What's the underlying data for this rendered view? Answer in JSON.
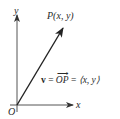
{
  "diagram": {
    "type": "vector-in-plane",
    "axes": {
      "x_label": "x",
      "y_label": "y",
      "origin_label": "O"
    },
    "point": {
      "label": "P(x, y)"
    },
    "vector": {
      "name": "v",
      "equals": "=",
      "from_to": "OP",
      "equals2": "=",
      "components": "⟨x, y⟩"
    },
    "colors": {
      "axis": "#555555",
      "vector": "#222222",
      "text": "#2a2a2a",
      "background": "#ffffff"
    }
  }
}
